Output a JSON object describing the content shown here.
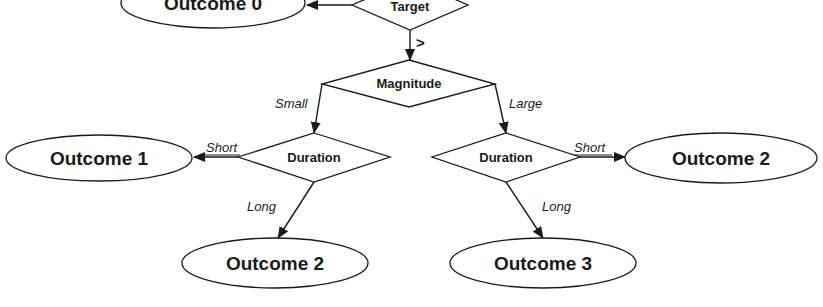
{
  "diagram": {
    "title": "",
    "nodes": {
      "outcome0": {
        "label": "Outcome 0",
        "type": "outcome"
      },
      "target": {
        "label": "Target",
        "type": "decision"
      },
      "magnitude": {
        "label": "Magnitude",
        "type": "decision"
      },
      "duration_left": {
        "label": "Duration",
        "type": "decision"
      },
      "duration_right": {
        "label": "Duration",
        "type": "decision"
      },
      "outcome1": {
        "label": "Outcome 1",
        "type": "outcome"
      },
      "outcome2_right": {
        "label": "Outcome 2",
        "type": "outcome"
      },
      "outcome2_bottom": {
        "label": "Outcome 2",
        "type": "outcome"
      },
      "outcome3": {
        "label": "Outcome 3",
        "type": "outcome"
      }
    },
    "edges": {
      "target_to_outcome0": {
        "from": "Target",
        "to": "Outcome 0",
        "label": ""
      },
      "target_to_magnitude": {
        "from": "Target",
        "to": "Magnitude",
        "label": ">"
      },
      "magnitude_small": {
        "from": "Magnitude",
        "to": "Duration",
        "label": "Small"
      },
      "magnitude_large": {
        "from": "Magnitude",
        "to": "Duration",
        "label": "Large"
      },
      "left_short": {
        "from": "Duration",
        "to": "Outcome 1",
        "label": "Short"
      },
      "left_long": {
        "from": "Duration",
        "to": "Outcome 2",
        "label": "Long"
      },
      "right_short": {
        "from": "Duration",
        "to": "Outcome 2",
        "label": "Short"
      },
      "right_long": {
        "from": "Duration",
        "to": "Outcome 3",
        "label": "Long"
      }
    }
  }
}
